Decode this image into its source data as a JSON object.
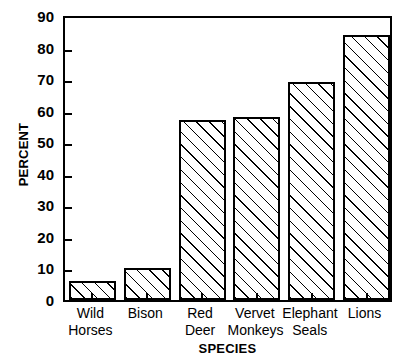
{
  "chart_data": {
    "type": "bar",
    "title": "",
    "xlabel": "SPECIES",
    "ylabel": "PERCENT",
    "categories": [
      "Wild Horses",
      "Bison",
      "Red Deer",
      "Vervet Monkeys",
      "Elephant Seals",
      "Lions"
    ],
    "category_lines": [
      [
        "Wild",
        "Horses"
      ],
      [
        "Bison",
        ""
      ],
      [
        "Red",
        "Deer"
      ],
      [
        "Vervet",
        "Monkeys"
      ],
      [
        "Elephant",
        "Seals"
      ],
      [
        "Lions",
        ""
      ]
    ],
    "values": [
      6,
      10,
      57,
      58,
      69,
      84
    ],
    "ylim": [
      0,
      90
    ],
    "yticks": [
      0,
      10,
      20,
      30,
      40,
      50,
      60,
      70,
      80,
      90
    ],
    "ytick_labels": [
      "0",
      "10",
      "20",
      "30",
      "40",
      "50",
      "60",
      "70",
      "80",
      "90"
    ],
    "grid": false,
    "legend": false,
    "bar_fill": "hatch-diagonal",
    "bar_edge_color": "#000000",
    "bar_face_color": "#ffffff",
    "axis_color": "#000000",
    "background_color": "#ffffff"
  }
}
